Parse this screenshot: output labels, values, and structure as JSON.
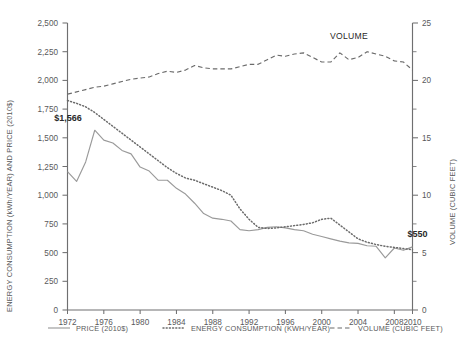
{
  "chart_data": {
    "type": "line",
    "title": "",
    "xlabel": "",
    "ylabel": "ENERGY CONSUMPTION (kWh/YEAR) AND PRICE (2010$)",
    "y2label": "VOLUME (CUBIC FEET)",
    "xlim": [
      1972,
      2010
    ],
    "ylim": [
      0,
      2500
    ],
    "y2lim": [
      0,
      25
    ],
    "grid": false,
    "legend_position": "bottom",
    "x_ticks": [
      "1972",
      "1976",
      "1980",
      "1984",
      "1988",
      "1992",
      "1996",
      "2000",
      "2004",
      "2008",
      "2010"
    ],
    "y_ticks": [
      "0",
      "250",
      "500",
      "750",
      "1,000",
      "1,250",
      "1,500",
      "1,750",
      "2,000",
      "2,250",
      "2,500"
    ],
    "y2_ticks": [
      "0",
      "5",
      "10",
      "15",
      "20",
      "25"
    ],
    "x": [
      1972,
      1973,
      1974,
      1975,
      1976,
      1977,
      1978,
      1979,
      1980,
      1981,
      1982,
      1983,
      1984,
      1985,
      1986,
      1987,
      1988,
      1989,
      1990,
      1991,
      1992,
      1993,
      1994,
      1995,
      1996,
      1997,
      1998,
      1999,
      2000,
      2001,
      2002,
      2003,
      2004,
      2005,
      2006,
      2007,
      2008,
      2009,
      2010
    ],
    "series": [
      {
        "name": "PRICE (2010$)",
        "axis": "left",
        "style": "solid",
        "color": "#9a9a9a",
        "values": [
          1205,
          1120,
          1290,
          1566,
          1480,
          1455,
          1390,
          1360,
          1245,
          1210,
          1130,
          1130,
          1060,
          1010,
          930,
          840,
          800,
          790,
          775,
          700,
          690,
          700,
          720,
          725,
          715,
          700,
          690,
          660,
          640,
          620,
          600,
          585,
          580,
          560,
          555,
          455,
          540,
          520,
          550
        ]
      },
      {
        "name": "ENERGY CONSUMPTION (KWH/YEAR)",
        "axis": "left",
        "style": "dotted",
        "color": "#6b6b6b",
        "values": [
          1825,
          1800,
          1770,
          1720,
          1660,
          1600,
          1540,
          1480,
          1420,
          1360,
          1300,
          1240,
          1190,
          1150,
          1130,
          1100,
          1070,
          1040,
          1000,
          880,
          790,
          720,
          710,
          715,
          725,
          735,
          745,
          760,
          790,
          800,
          740,
          680,
          620,
          590,
          570,
          555,
          545,
          535,
          525
        ]
      },
      {
        "name": "VOLUME (CUBIC FEET)",
        "axis": "right",
        "style": "dashed",
        "color": "#6b6b6b",
        "values": [
          18.8,
          19.0,
          19.2,
          19.4,
          19.5,
          19.7,
          19.9,
          20.1,
          20.2,
          20.3,
          20.6,
          20.8,
          20.7,
          20.9,
          21.3,
          21.1,
          21.0,
          21.0,
          21.0,
          21.2,
          21.4,
          21.4,
          21.8,
          22.2,
          22.1,
          22.3,
          22.4,
          22.0,
          21.6,
          21.6,
          22.4,
          21.8,
          22.0,
          22.5,
          22.3,
          22.1,
          21.7,
          21.6,
          20.9
        ]
      }
    ],
    "annotations": [
      {
        "text": "$1,566",
        "x": 1974,
        "y": 1566
      },
      {
        "text": "$550",
        "x": 2009,
        "y": 550
      },
      {
        "text": "VOLUME",
        "x": 2003,
        "y": 23.6
      }
    ]
  },
  "legend": {
    "items": [
      {
        "label": "PRICE (2010$)",
        "style": "solid"
      },
      {
        "label": "ENERGY CONSUMPTION (KWH/YEAR)",
        "style": "dotted"
      },
      {
        "label": "VOLUME (CUBIC FEET)",
        "style": "dashed"
      }
    ]
  }
}
